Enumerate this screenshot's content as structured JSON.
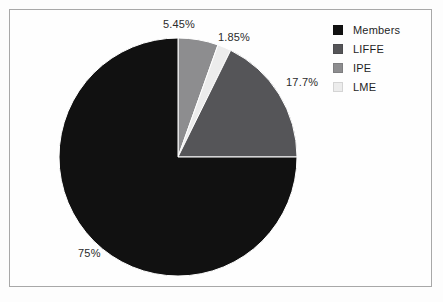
{
  "chart_data": {
    "type": "pie",
    "title": "",
    "subtitle": "",
    "xlabel": "",
    "ylabel": "",
    "grid": false,
    "legend_position": "top-right",
    "start_angle_deg": 0,
    "direction": "clockwise",
    "center": {
      "x": 178,
      "y": 157
    },
    "radius": 119,
    "categories": [
      "Members",
      "LIFFE",
      "IPE",
      "LME"
    ],
    "values": [
      75,
      17.7,
      5.45,
      1.85
    ],
    "value_labels": [
      "75%",
      "17.7%",
      "5.45%",
      "1.85%"
    ],
    "colors": [
      "#111111",
      "#555558",
      "#8d8d8f",
      "#ececec"
    ],
    "slices": [
      {
        "name": "IPE",
        "value": 5.45,
        "label": "5.45%",
        "color": "#8d8d8f",
        "start_deg": 0,
        "end_deg": 19.62
      },
      {
        "name": "LME",
        "value": 1.85,
        "label": "1.85%",
        "color": "#ececec",
        "start_deg": 19.62,
        "end_deg": 26.28
      },
      {
        "name": "LIFFE",
        "value": 17.7,
        "label": "17.7%",
        "color": "#555558",
        "start_deg": 26.28,
        "end_deg": 90.0
      },
      {
        "name": "Members",
        "value": 75,
        "label": "75%",
        "color": "#111111",
        "start_deg": 90.0,
        "end_deg": 360.0
      }
    ]
  },
  "labels": {
    "ipe_pct": "5.45%",
    "lme_pct": "1.85%",
    "liffe_pct": "17.7%",
    "members_pct": "75%"
  },
  "legend": {
    "items": [
      {
        "label": "Members",
        "color": "#111111"
      },
      {
        "label": "LIFFE",
        "color": "#555558"
      },
      {
        "label": "IPE",
        "color": "#8d8d8f"
      },
      {
        "label": "LME",
        "color": "#ececec"
      }
    ]
  },
  "style": {
    "background": "#fdfdfd",
    "frame_color": "#a8a8a8",
    "text_color": "#2b2b2b"
  }
}
